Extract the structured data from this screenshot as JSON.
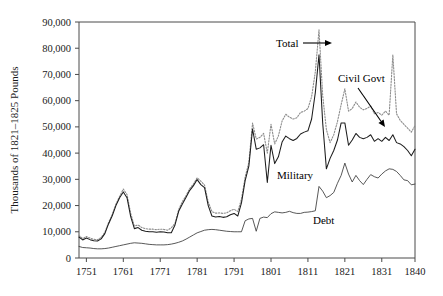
{
  "chart_data": {
    "type": "line",
    "title": "",
    "xlabel": "",
    "ylabel": "Thousands of 1821–1825 Pounds",
    "xlim": [
      1749,
      1840
    ],
    "ylim": [
      0,
      90000
    ],
    "grid": false,
    "legend_position": "inline-annotations",
    "xticks": [
      1751,
      1761,
      1771,
      1781,
      1791,
      1801,
      1811,
      1821,
      1831,
      1840
    ],
    "xtick_labels": [
      "1751",
      "1761",
      "1771",
      "1781",
      "1791",
      "1801",
      "1811",
      "1821",
      "1831",
      "1840"
    ],
    "yticks": [
      0,
      10000,
      20000,
      30000,
      40000,
      50000,
      60000,
      70000,
      80000,
      90000
    ],
    "ytick_labels": [
      "0",
      "10,000",
      "20,000",
      "30,000",
      "40,000",
      "50,000",
      "60,000",
      "70,000",
      "80,000",
      "90,000"
    ],
    "annotations": [
      {
        "name": "Total",
        "text": "Total",
        "text_x": 276,
        "text_y": 47,
        "arrow_x1": 303,
        "arrow_y1": 43,
        "arrow_x2": 332,
        "arrow_y2": 43,
        "style": "dotted-gray"
      },
      {
        "name": "Civil Govt",
        "text": "Civil Govt",
        "text_x": 338,
        "text_y": 82,
        "arrow_x1": 358,
        "arrow_y1": 88,
        "arrow_x2": 385,
        "arrow_y2": 127,
        "style": "gap"
      },
      {
        "name": "Military",
        "text": "Military",
        "text_x": 277,
        "text_y": 179,
        "arrow_x1": null,
        "arrow_y1": null,
        "arrow_x2": null,
        "arrow_y2": null,
        "style": "solid-black"
      },
      {
        "name": "Debt",
        "text": "Debt",
        "text_x": 313,
        "text_y": 224,
        "arrow_x1": null,
        "arrow_y1": null,
        "arrow_x2": null,
        "arrow_y2": null,
        "style": "thin-dark"
      }
    ],
    "x": [
      1749,
      1750,
      1751,
      1752,
      1753,
      1754,
      1755,
      1756,
      1757,
      1758,
      1759,
      1760,
      1761,
      1762,
      1763,
      1764,
      1765,
      1766,
      1767,
      1768,
      1769,
      1770,
      1771,
      1772,
      1773,
      1774,
      1775,
      1776,
      1777,
      1778,
      1779,
      1780,
      1781,
      1782,
      1783,
      1784,
      1785,
      1786,
      1787,
      1788,
      1789,
      1790,
      1791,
      1792,
      1793,
      1794,
      1795,
      1796,
      1797,
      1798,
      1799,
      1800,
      1801,
      1802,
      1803,
      1804,
      1805,
      1806,
      1807,
      1808,
      1809,
      1810,
      1811,
      1812,
      1813,
      1814,
      1815,
      1816,
      1817,
      1818,
      1819,
      1820,
      1821,
      1822,
      1823,
      1824,
      1825,
      1826,
      1827,
      1828,
      1829,
      1830,
      1831,
      1832,
      1833,
      1834,
      1835,
      1836,
      1837,
      1838,
      1839,
      1840
    ],
    "series": [
      {
        "name": "Total",
        "style": "dotted",
        "color": "#8d8d8d",
        "values": [
          8600,
          7400,
          8200,
          7600,
          7100,
          7000,
          7800,
          9800,
          13500,
          16600,
          20500,
          23500,
          26300,
          24200,
          17000,
          12200,
          12600,
          11600,
          11200,
          11000,
          11000,
          10800,
          11000,
          10900,
          10600,
          11500,
          13200,
          18500,
          21500,
          23800,
          26500,
          28200,
          30600,
          29300,
          27800,
          21400,
          17700,
          17100,
          17200,
          17000,
          17200,
          18000,
          18600,
          17700,
          22400,
          30900,
          36500,
          51500,
          45400,
          46000,
          47500,
          40000,
          51000,
          43500,
          46500,
          52200,
          54800,
          53700,
          53000,
          53500,
          55500,
          56000,
          57000,
          61500,
          71000,
          87000,
          62000,
          49000,
          44000,
          47000,
          52000,
          58500,
          64500,
          56000,
          57000,
          59500,
          57500,
          56500,
          57000,
          58000,
          55000,
          55500,
          54500,
          56000,
          54500,
          77500,
          55000,
          52500,
          51000,
          49500,
          48000,
          50500
        ]
      },
      {
        "name": "Military",
        "style": "solid",
        "color": "#1c1c1c",
        "values": [
          8000,
          6900,
          7600,
          7000,
          6600,
          6500,
          7300,
          9300,
          13000,
          16100,
          20000,
          23000,
          25200,
          23000,
          15800,
          11200,
          11600,
          10600,
          10200,
          10000,
          10000,
          9800,
          10000,
          9900,
          9600,
          9600,
          12600,
          17800,
          20600,
          23200,
          25800,
          27600,
          29900,
          28000,
          26800,
          20000,
          16000,
          15600,
          15800,
          15500,
          15700,
          16500,
          17000,
          16000,
          21000,
          29500,
          35000,
          49200,
          41500,
          42000,
          43200,
          28800,
          43000,
          36000,
          38600,
          44200,
          46500,
          45500,
          44800,
          45600,
          47300,
          48000,
          48500,
          53000,
          63000,
          77500,
          51500,
          34000,
          38000,
          41000,
          45000,
          51500,
          51500,
          43000,
          45000,
          47500,
          46000,
          45500,
          46000,
          47000,
          44500,
          45500,
          44500,
          46000,
          44800,
          47000,
          44000,
          43500,
          42500,
          41000,
          39000,
          41500
        ]
      },
      {
        "name": "Debt",
        "style": "thin",
        "color": "#3a3a3a",
        "values": [
          4400,
          4000,
          3900,
          3800,
          3600,
          3500,
          3500,
          3600,
          3800,
          4100,
          4400,
          4700,
          5000,
          5300,
          5600,
          5800,
          5700,
          5600,
          5400,
          5200,
          5100,
          5000,
          5000,
          5000,
          5100,
          5300,
          5600,
          6000,
          6500,
          7200,
          8000,
          8800,
          9600,
          10100,
          10600,
          10800,
          10900,
          10800,
          10600,
          10400,
          10200,
          10100,
          10000,
          10000,
          10000,
          14200,
          14900,
          15100,
          10200,
          15100,
          15600,
          15400,
          16900,
          17600,
          17400,
          17200,
          17400,
          17800,
          17300,
          17000,
          17000,
          17400,
          17500,
          17700,
          18000,
          27300,
          25500,
          23000,
          23800,
          25000,
          28500,
          31500,
          36200,
          32000,
          29000,
          31500,
          29500,
          28000,
          30000,
          31800,
          31000,
          30500,
          32000,
          33200,
          34000,
          33800,
          33000,
          31500,
          29800,
          29500,
          27900,
          28200
        ]
      }
    ]
  }
}
